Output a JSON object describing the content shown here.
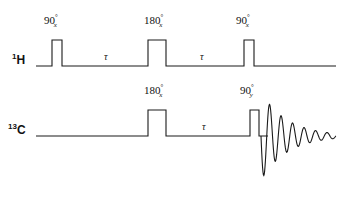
{
  "figure": {
    "type": "nmr-pulse-sequence",
    "background": "#ffffff",
    "stroke_color": "#1a1a1a",
    "stroke_width": 1.1,
    "width": 348,
    "height": 198
  },
  "channels": [
    {
      "id": "proton",
      "nucleus": "H",
      "mass_number": "1",
      "label_text": "H",
      "baseline_y": 66,
      "line_start_x": 36,
      "line_end_x": 336
    },
    {
      "id": "carbon",
      "nucleus": "C",
      "mass_number": "13",
      "label_text": "C",
      "baseline_y": 136,
      "line_start_x": 36,
      "line_end_x": 268
    }
  ],
  "pulses": [
    {
      "channel": "proton",
      "name": "proton-90-x-first",
      "angle": "90",
      "degree_symbol": "°",
      "phase": "x",
      "x": 52,
      "width": 10,
      "height": 26,
      "label_x": 44,
      "label_y": 14
    },
    {
      "channel": "proton",
      "name": "proton-180-x",
      "angle": "180",
      "degree_symbol": "°",
      "phase": "x",
      "x": 148,
      "width": 18,
      "height": 26,
      "label_x": 144,
      "label_y": 14
    },
    {
      "channel": "proton",
      "name": "proton-90-x-second",
      "angle": "90",
      "degree_symbol": "°",
      "phase": "x",
      "x": 244,
      "width": 10,
      "height": 26,
      "label_x": 236,
      "label_y": 14
    },
    {
      "channel": "carbon",
      "name": "carbon-180-x",
      "angle": "180",
      "degree_symbol": "°",
      "phase": "x",
      "x": 148,
      "width": 18,
      "height": 26,
      "label_x": 144,
      "label_y": 84
    },
    {
      "channel": "carbon",
      "name": "carbon-90-y",
      "angle": "90",
      "degree_symbol": "°",
      "phase": "y",
      "x": 250,
      "width": 9,
      "height": 26,
      "label_x": 240,
      "label_y": 84
    }
  ],
  "delays": [
    {
      "name": "proton-tau-first",
      "channel": "proton",
      "symbol": "τ",
      "x": 104,
      "y": 52
    },
    {
      "name": "proton-tau-second",
      "channel": "proton",
      "symbol": "τ",
      "x": 200,
      "y": 52
    },
    {
      "name": "carbon-tau",
      "channel": "carbon",
      "symbol": "τ",
      "x": 202,
      "y": 122
    }
  ],
  "fid": {
    "name": "carbon-fid",
    "start_x": 261,
    "baseline_y": 136,
    "initial_amplitude": 44,
    "decay_constant": 26,
    "period": 11.5,
    "end_x": 336,
    "description": "damped free induction decay"
  }
}
